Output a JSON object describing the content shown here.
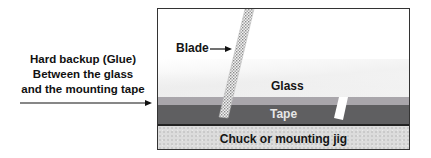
{
  "left_annotation": {
    "lines": [
      "Hard backup (Glue)",
      "Between the glass",
      "and the mounting tape"
    ]
  },
  "diagram": {
    "blade_label": "Blade",
    "glass_label": "Glass",
    "tape_label": "Tape",
    "chuck_label": "Chuck or mounting jig"
  },
  "colors": {
    "glass": "#ffffff",
    "glue": "#a9a6ab",
    "tape": "#5f5f61",
    "chuck": "#dcdcdc",
    "border": "#333333"
  }
}
